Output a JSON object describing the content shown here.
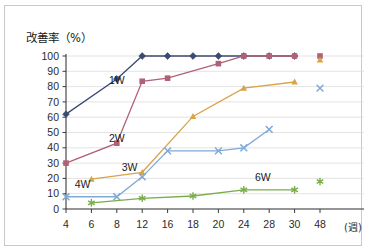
{
  "figure": {
    "axis_title": "改善率（%）",
    "x_unit_label": "(週)"
  },
  "chart_data": {
    "type": "line",
    "title": "改善率（%）",
    "xlabel": "(週)",
    "ylabel": "改善率（%）",
    "x": [
      4,
      6,
      8,
      12,
      16,
      18,
      20,
      24,
      28,
      30,
      48
    ],
    "xtick_labels": [
      "4",
      "6",
      "8",
      "12",
      "16",
      "18",
      "20",
      "24",
      "28",
      "30",
      "48"
    ],
    "ytick_labels": [
      "0",
      "10",
      "20",
      "30",
      "40",
      "50",
      "60",
      "70",
      "80",
      "90",
      "100"
    ],
    "ylim": [
      0,
      100
    ],
    "ystep": 10,
    "grid": "horizontal",
    "legend": "inline-labels",
    "series": [
      {
        "name": "1W",
        "color": "#3b4a72",
        "marker": "diamond",
        "label_x": 8,
        "label_y": 82,
        "points": [
          {
            "x": 4,
            "y": 62
          },
          {
            "x": 8,
            "y": 85
          },
          {
            "x": 12,
            "y": 100
          },
          {
            "x": 16,
            "y": 100
          },
          {
            "x": 18,
            "y": 100
          },
          {
            "x": 20,
            "y": 100
          },
          {
            "x": 24,
            "y": 100
          },
          {
            "x": 28,
            "y": 100
          },
          {
            "x": 30,
            "y": 100
          }
        ]
      },
      {
        "name": "2W",
        "color": "#b06176",
        "marker": "square",
        "label_x": 8,
        "label_y": 44,
        "points": [
          {
            "x": 4,
            "y": 30
          },
          {
            "x": 8,
            "y": 43
          },
          {
            "x": 12,
            "y": 83.5
          },
          {
            "x": 16,
            "y": 85.5
          },
          {
            "x": 20,
            "y": 95
          },
          {
            "x": 24,
            "y": 100
          },
          {
            "x": 28,
            "y": 100
          },
          {
            "x": 30,
            "y": 100
          }
        ],
        "endpoint": {
          "x": 48,
          "y": 100
        }
      },
      {
        "name": "3W",
        "color": "#d9a348",
        "marker": "triangle",
        "label_x": 10,
        "label_y": 25,
        "points": [
          {
            "x": 6,
            "y": 19.5
          },
          {
            "x": 12,
            "y": 24
          },
          {
            "x": 18,
            "y": 60.5
          },
          {
            "x": 24,
            "y": 79
          },
          {
            "x": 30,
            "y": 83
          }
        ],
        "endpoint": {
          "x": 48,
          "y": 97.5
        }
      },
      {
        "name": "4W",
        "color": "#7fa9d6",
        "marker": "x",
        "label_x": 5.3,
        "label_y": 14,
        "points": [
          {
            "x": 4,
            "y": 8
          },
          {
            "x": 8,
            "y": 8
          },
          {
            "x": 12,
            "y": 21
          },
          {
            "x": 16,
            "y": 38
          },
          {
            "x": 20,
            "y": 38
          },
          {
            "x": 24,
            "y": 40
          },
          {
            "x": 28,
            "y": 52
          }
        ],
        "endpoint": {
          "x": 48,
          "y": 79
        }
      },
      {
        "name": "6W",
        "color": "#79ad4a",
        "marker": "star",
        "label_x": 27,
        "label_y": 18,
        "points": [
          {
            "x": 6,
            "y": 4
          },
          {
            "x": 12,
            "y": 7
          },
          {
            "x": 18,
            "y": 8.5
          },
          {
            "x": 24,
            "y": 12.5
          },
          {
            "x": 30,
            "y": 12.5
          }
        ],
        "endpoint": {
          "x": 48,
          "y": 18
        }
      }
    ]
  }
}
